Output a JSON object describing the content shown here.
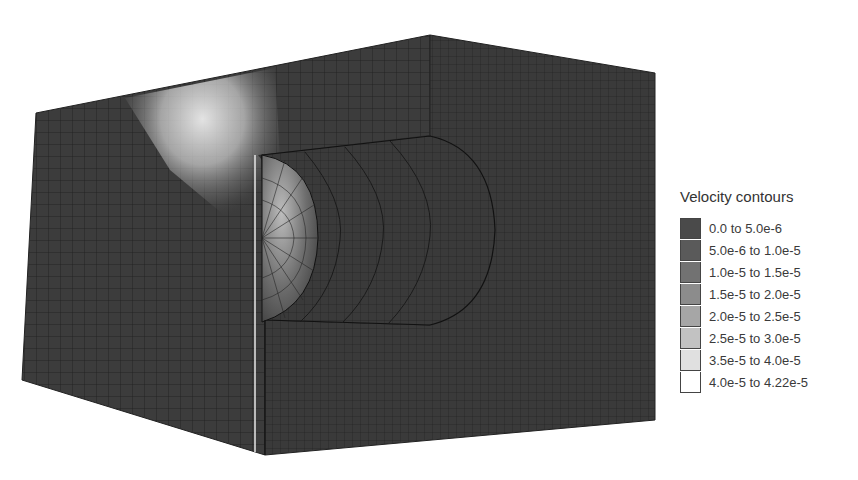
{
  "figure": {
    "colors": {
      "mesh_dark": "#3c3c3c",
      "mesh_line": "#1e1e1e",
      "plume_light": "#e6e6e6",
      "background": "#ffffff"
    }
  },
  "legend": {
    "title": "Velocity contours",
    "items": [
      {
        "label": "0.0 to 5.0e-6",
        "color": "#4a4a4a"
      },
      {
        "label": "5.0e-6 to 1.0e-5",
        "color": "#5a5a5a"
      },
      {
        "label": "1.0e-5 to 1.5e-5",
        "color": "#727272"
      },
      {
        "label": "1.5e-5 to 2.0e-5",
        "color": "#8c8c8c"
      },
      {
        "label": "2.0e-5 to 2.5e-5",
        "color": "#a6a6a6"
      },
      {
        "label": "2.5e-5 to 3.0e-5",
        "color": "#c2c2c2"
      },
      {
        "label": "3.5e-5 to 4.0e-5",
        "color": "#e0e0e0"
      },
      {
        "label": "4.0e-5 to 4.22e-5",
        "color": "#ffffff"
      }
    ]
  }
}
